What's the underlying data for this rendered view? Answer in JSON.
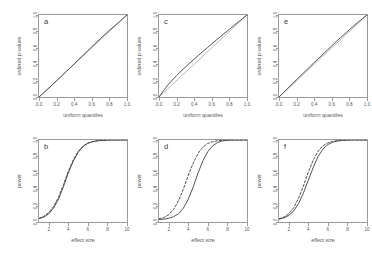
{
  "figure": {
    "layout": "2 rows x 3 columns",
    "background": "#ffffff",
    "line_color": "#404040",
    "reference_color": "#b0b0b0"
  },
  "chart_data": [
    {
      "id": "a",
      "type": "line",
      "panel_label": "a",
      "title": "",
      "xlabel": "uniform quantiles",
      "ylabel": "ordered p-values",
      "xlim": [
        0,
        1
      ],
      "ylim": [
        0,
        1
      ],
      "xticks": [
        "0.0",
        "0.2",
        "0.4",
        "0.6",
        "0.8",
        "1.0"
      ],
      "yticks": [
        "0.0",
        "0.2",
        "0.4",
        "0.6",
        "0.8",
        "1.0"
      ],
      "grid": false,
      "legend": "none",
      "series": [
        {
          "name": "reference diagonal",
          "style": "solid-grey",
          "x": [
            0,
            1
          ],
          "values": [
            0,
            1
          ]
        },
        {
          "name": "ordered p-values",
          "style": "solid",
          "x": [
            0.0,
            0.05,
            0.1,
            0.15,
            0.2,
            0.25,
            0.3,
            0.35,
            0.4,
            0.45,
            0.5,
            0.55,
            0.6,
            0.65,
            0.7,
            0.75,
            0.8,
            0.85,
            0.9,
            0.95,
            1.0
          ],
          "values": [
            0.0,
            0.048,
            0.097,
            0.147,
            0.198,
            0.249,
            0.3,
            0.352,
            0.404,
            0.456,
            0.508,
            0.56,
            0.612,
            0.663,
            0.714,
            0.764,
            0.812,
            0.859,
            0.905,
            0.953,
            1.0
          ]
        }
      ]
    },
    {
      "id": "b",
      "type": "line",
      "panel_label": "b",
      "title": "",
      "xlabel": "effect size",
      "ylabel": "power",
      "xlim": [
        1,
        10
      ],
      "ylim": [
        0,
        1
      ],
      "xticks": [
        "2",
        "4",
        "6",
        "8",
        "10"
      ],
      "yticks": [
        "0.0",
        "0.2",
        "0.4",
        "0.6",
        "0.8",
        "1.0"
      ],
      "grid": false,
      "legend": "none",
      "series": [
        {
          "name": "power solid",
          "style": "solid",
          "x": [
            1.0,
            1.5,
            2.0,
            2.5,
            3.0,
            3.5,
            4.0,
            4.5,
            5.0,
            5.5,
            6.0,
            6.5,
            7.0,
            7.5,
            8.0,
            8.5,
            9.0,
            9.5,
            10.0
          ],
          "values": [
            0.04,
            0.06,
            0.1,
            0.17,
            0.28,
            0.43,
            0.6,
            0.74,
            0.85,
            0.92,
            0.96,
            0.98,
            0.99,
            0.995,
            0.998,
            0.999,
            1.0,
            1.0,
            1.0
          ]
        },
        {
          "name": "power dashed",
          "style": "dashed",
          "x": [
            1.0,
            1.5,
            2.0,
            2.5,
            3.0,
            3.5,
            4.0,
            4.5,
            5.0,
            5.5,
            6.0,
            6.5,
            7.0,
            7.5,
            8.0,
            8.5,
            9.0,
            9.5,
            10.0
          ],
          "values": [
            0.045,
            0.07,
            0.115,
            0.19,
            0.305,
            0.455,
            0.62,
            0.755,
            0.86,
            0.925,
            0.963,
            0.982,
            0.992,
            0.996,
            0.999,
            1.0,
            1.0,
            1.0,
            1.0
          ]
        }
      ]
    },
    {
      "id": "c",
      "type": "line",
      "panel_label": "c",
      "title": "",
      "xlabel": "uniform quantiles",
      "ylabel": "ordered p-values",
      "xlim": [
        0,
        1
      ],
      "ylim": [
        0,
        1
      ],
      "xticks": [
        "0.0",
        "0.2",
        "0.4",
        "0.6",
        "0.8",
        "1.0"
      ],
      "yticks": [
        "0.0",
        "0.2",
        "0.4",
        "0.6",
        "0.8",
        "1.0"
      ],
      "grid": false,
      "legend": "none",
      "series": [
        {
          "name": "reference diagonal",
          "style": "solid-grey",
          "x": [
            0,
            1
          ],
          "values": [
            0,
            1
          ]
        },
        {
          "name": "ordered p-values",
          "style": "solid",
          "x": [
            0.0,
            0.05,
            0.1,
            0.15,
            0.2,
            0.25,
            0.3,
            0.35,
            0.4,
            0.45,
            0.5,
            0.55,
            0.6,
            0.65,
            0.7,
            0.75,
            0.8,
            0.85,
            0.9,
            0.95,
            1.0
          ],
          "values": [
            0.0,
            0.075,
            0.145,
            0.205,
            0.262,
            0.315,
            0.365,
            0.415,
            0.462,
            0.51,
            0.556,
            0.602,
            0.648,
            0.693,
            0.738,
            0.782,
            0.826,
            0.87,
            0.913,
            0.957,
            1.0
          ]
        }
      ]
    },
    {
      "id": "d",
      "type": "line",
      "panel_label": "d",
      "title": "",
      "xlabel": "effect size",
      "ylabel": "power",
      "xlim": [
        1,
        10
      ],
      "ylim": [
        0,
        1
      ],
      "xticks": [
        "2",
        "4",
        "6",
        "8",
        "10"
      ],
      "yticks": [
        "0.0",
        "0.2",
        "0.4",
        "0.6",
        "0.8",
        "1.0"
      ],
      "grid": false,
      "legend": "none",
      "series": [
        {
          "name": "power solid",
          "style": "solid",
          "x": [
            1.0,
            1.5,
            2.0,
            2.5,
            3.0,
            3.5,
            4.0,
            4.5,
            5.0,
            5.5,
            6.0,
            6.5,
            7.0,
            7.5,
            8.0,
            8.5,
            9.0,
            9.5,
            10.0
          ],
          "values": [
            0.03,
            0.035,
            0.045,
            0.065,
            0.1,
            0.17,
            0.28,
            0.43,
            0.6,
            0.75,
            0.86,
            0.93,
            0.97,
            0.99,
            0.996,
            0.999,
            1.0,
            1.0,
            1.0
          ]
        },
        {
          "name": "power dashed",
          "style": "dashed",
          "x": [
            1.0,
            1.5,
            2.0,
            2.5,
            3.0,
            3.5,
            4.0,
            4.5,
            5.0,
            5.5,
            6.0,
            6.5,
            7.0,
            7.5,
            8.0,
            8.5,
            9.0,
            9.5,
            10.0
          ],
          "values": [
            0.04,
            0.055,
            0.09,
            0.155,
            0.26,
            0.405,
            0.57,
            0.72,
            0.84,
            0.915,
            0.958,
            0.98,
            0.991,
            0.996,
            0.999,
            1.0,
            1.0,
            1.0,
            1.0
          ]
        }
      ]
    },
    {
      "id": "e",
      "type": "line",
      "panel_label": "e",
      "title": "",
      "xlabel": "uniform quantiles",
      "ylabel": "ordered p-values",
      "xlim": [
        0,
        1
      ],
      "ylim": [
        0,
        1
      ],
      "xticks": [
        "0.0",
        "0.2",
        "0.4",
        "0.6",
        "0.8",
        "1.0"
      ],
      "yticks": [
        "0.0",
        "0.2",
        "0.4",
        "0.6",
        "0.8",
        "1.0"
      ],
      "grid": false,
      "legend": "none",
      "series": [
        {
          "name": "reference diagonal",
          "style": "solid-grey",
          "x": [
            0,
            1
          ],
          "values": [
            0,
            1
          ]
        },
        {
          "name": "ordered p-values",
          "style": "solid",
          "x": [
            0.0,
            0.05,
            0.1,
            0.15,
            0.2,
            0.25,
            0.3,
            0.35,
            0.4,
            0.45,
            0.5,
            0.55,
            0.6,
            0.65,
            0.7,
            0.75,
            0.8,
            0.85,
            0.9,
            0.95,
            1.0
          ],
          "values": [
            0.0,
            0.053,
            0.106,
            0.159,
            0.212,
            0.264,
            0.316,
            0.368,
            0.42,
            0.471,
            0.522,
            0.573,
            0.624,
            0.674,
            0.724,
            0.773,
            0.821,
            0.868,
            0.913,
            0.957,
            1.0
          ]
        }
      ]
    },
    {
      "id": "f",
      "type": "line",
      "panel_label": "f",
      "title": "",
      "xlabel": "effect size",
      "ylabel": "power",
      "xlim": [
        1,
        10
      ],
      "ylim": [
        0,
        1
      ],
      "xticks": [
        "2",
        "4",
        "6",
        "8",
        "10"
      ],
      "yticks": [
        "0.0",
        "0.2",
        "0.4",
        "0.6",
        "0.8",
        "1.0"
      ],
      "grid": false,
      "legend": "none",
      "series": [
        {
          "name": "power solid",
          "style": "solid",
          "x": [
            1.0,
            1.5,
            2.0,
            2.5,
            3.0,
            3.5,
            4.0,
            4.5,
            5.0,
            5.5,
            6.0,
            6.5,
            7.0,
            7.5,
            8.0,
            8.5,
            9.0,
            9.5,
            10.0
          ],
          "values": [
            0.035,
            0.05,
            0.08,
            0.135,
            0.225,
            0.355,
            0.51,
            0.665,
            0.8,
            0.89,
            0.945,
            0.974,
            0.988,
            0.995,
            0.998,
            1.0,
            1.0,
            1.0,
            1.0
          ]
        },
        {
          "name": "power dashed",
          "style": "dashed",
          "x": [
            1.0,
            1.5,
            2.0,
            2.5,
            3.0,
            3.5,
            4.0,
            4.5,
            5.0,
            5.5,
            6.0,
            6.5,
            7.0,
            7.5,
            8.0,
            8.5,
            9.0,
            9.5,
            10.0
          ],
          "values": [
            0.04,
            0.06,
            0.1,
            0.175,
            0.29,
            0.44,
            0.61,
            0.755,
            0.865,
            0.93,
            0.966,
            0.984,
            0.993,
            0.997,
            0.999,
            1.0,
            1.0,
            1.0,
            1.0
          ]
        }
      ]
    }
  ]
}
